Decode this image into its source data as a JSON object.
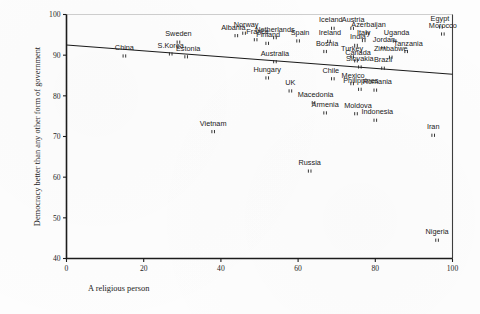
{
  "figure": {
    "type": "scatter-plot",
    "background_color": "#fdfdfd",
    "ink_color": "#1c1c1c"
  },
  "axes": {
    "x_title": "A religious person",
    "y_title": "Democracy better than any other form of government",
    "x_ticks": [
      "0",
      "20",
      "40",
      "60",
      "80",
      "100"
    ],
    "y_ticks": [
      "40",
      "50",
      "60",
      "70",
      "80",
      "90",
      "100"
    ]
  },
  "chart_data": {
    "type": "scatter",
    "title": "",
    "subtitle": "",
    "xlabel": "A religious person",
    "ylabel": "Democracy better than any other form of government",
    "xlim": [
      0,
      100
    ],
    "ylim": [
      40,
      100
    ],
    "xticks": [
      0,
      20,
      40,
      60,
      80,
      100
    ],
    "yticks": [
      40,
      50,
      60,
      70,
      80,
      90,
      100
    ],
    "grid": false,
    "legend": "none",
    "point_marker": "double-tick",
    "trendline": {
      "label": "linear fit",
      "x_start": 0,
      "y_start": 92.5,
      "x_end": 100,
      "y_end": 85.3
    },
    "points": [
      {
        "label": "China",
        "x": 15,
        "y": 89.8,
        "label_dx": 0,
        "label_dy": -6
      },
      {
        "label": "S.Korea",
        "x": 27,
        "y": 90.3,
        "label_dx": 0,
        "label_dy": -6
      },
      {
        "label": "Estonia",
        "x": 31,
        "y": 89.6,
        "label_dx": 2,
        "label_dy": -6
      },
      {
        "label": "Sweden",
        "x": 29,
        "y": 93.2,
        "label_dx": 0,
        "label_dy": -6
      },
      {
        "label": "Albania",
        "x": 44,
        "y": 94.8,
        "label_dx": -3,
        "label_dy": -6
      },
      {
        "label": "Norway",
        "x": 46,
        "y": 95.4,
        "label_dx": 2,
        "label_dy": -6
      },
      {
        "label": "France",
        "x": 49,
        "y": 93.8,
        "label_dx": 2,
        "label_dy": -6
      },
      {
        "label": "Netherlands",
        "x": 54,
        "y": 94.3,
        "label_dx": 0,
        "label_dy": -6
      },
      {
        "label": "Finland",
        "x": 52,
        "y": 92.9,
        "label_dx": 1,
        "label_dy": -6
      },
      {
        "label": "Spain",
        "x": 60,
        "y": 93.5,
        "label_dx": 2,
        "label_dy": -6
      },
      {
        "label": "Iceland",
        "x": 69,
        "y": 96.6,
        "label_dx": -2,
        "label_dy": -6
      },
      {
        "label": "Austria",
        "x": 74,
        "y": 96.6,
        "label_dx": 1,
        "label_dy": -6
      },
      {
        "label": "Azerbaijan",
        "x": 78,
        "y": 95.4,
        "label_dx": 1,
        "label_dy": -6
      },
      {
        "label": "Italy",
        "x": 77,
        "y": 93.6,
        "label_dx": 0,
        "label_dy": -6
      },
      {
        "label": "Uganda",
        "x": 85,
        "y": 93.5,
        "label_dx": 2,
        "label_dy": -6
      },
      {
        "label": "Egypt",
        "x": 97,
        "y": 96.9,
        "label_dx": -1,
        "label_dy": -6
      },
      {
        "label": "Morocco",
        "x": 97.5,
        "y": 95.2,
        "label_dx": 0,
        "label_dy": -6
      },
      {
        "label": "Ireland",
        "x": 68,
        "y": 93.4,
        "label_dx": 1,
        "label_dy": -6
      },
      {
        "label": "India",
        "x": 75,
        "y": 92.4,
        "label_dx": 2,
        "label_dy": -6
      },
      {
        "label": "Jordan",
        "x": 82,
        "y": 91.8,
        "label_dx": 1,
        "label_dy": -6
      },
      {
        "label": "Bosnia",
        "x": 67,
        "y": 90.9,
        "label_dx": 2,
        "label_dy": -6
      },
      {
        "label": "Tanzania",
        "x": 88,
        "y": 90.9,
        "label_dx": 2,
        "label_dy": -6
      },
      {
        "label": "Turkey",
        "x": 74,
        "y": 89.6,
        "label_dx": 0,
        "label_dy": -6
      },
      {
        "label": "Canada",
        "x": 75,
        "y": 88.6,
        "label_dx": 2,
        "label_dy": -6
      },
      {
        "label": "Zimbabwe",
        "x": 84,
        "y": 89.5,
        "label_dx": 0,
        "label_dy": -6
      },
      {
        "label": "Australia",
        "x": 54,
        "y": 88.4,
        "label_dx": 0,
        "label_dy": -6
      },
      {
        "label": "Slovakia",
        "x": 76,
        "y": 87.1,
        "label_dx": 0,
        "label_dy": -6
      },
      {
        "label": "Brazil",
        "x": 82,
        "y": 86.8,
        "label_dx": 0,
        "label_dy": -6
      },
      {
        "label": "Hungary",
        "x": 52,
        "y": 84.4,
        "label_dx": 0,
        "label_dy": -6
      },
      {
        "label": "Chile",
        "x": 69,
        "y": 84.2,
        "label_dx": -2,
        "label_dy": -6
      },
      {
        "label": "Mexico",
        "x": 74,
        "y": 83.0,
        "label_dx": 1,
        "label_dy": -6
      },
      {
        "label": "Philippines",
        "x": 76,
        "y": 81.6,
        "label_dx": 1,
        "label_dy": -6
      },
      {
        "label": "Romania",
        "x": 80,
        "y": 81.4,
        "label_dx": 2,
        "label_dy": -6
      },
      {
        "label": "UK",
        "x": 58,
        "y": 81.2,
        "label_dx": 0,
        "label_dy": -6
      },
      {
        "label": "Macedonia",
        "x": 64,
        "y": 78.3,
        "label_dx": 2,
        "label_dy": -6
      },
      {
        "label": "Armenia",
        "x": 67,
        "y": 75.8,
        "label_dx": 0,
        "label_dy": -6
      },
      {
        "label": "Moldova",
        "x": 75,
        "y": 75.6,
        "label_dx": 2,
        "label_dy": -6
      },
      {
        "label": "Indonesia",
        "x": 80,
        "y": 74.0,
        "label_dx": 2,
        "label_dy": -6
      },
      {
        "label": "Vietnam",
        "x": 38,
        "y": 71.2,
        "label_dx": 0,
        "label_dy": -6
      },
      {
        "label": "Iran",
        "x": 95,
        "y": 70.3,
        "label_dx": 0,
        "label_dy": -6
      },
      {
        "label": "Russia",
        "x": 63,
        "y": 61.5,
        "label_dx": 0,
        "label_dy": -6
      },
      {
        "label": "Nigeria",
        "x": 96,
        "y": 44.5,
        "label_dx": 0,
        "label_dy": -6
      }
    ]
  }
}
